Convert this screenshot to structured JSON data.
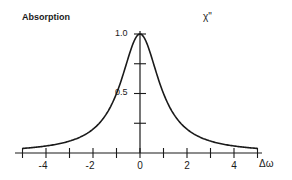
{
  "chart_data": {
    "type": "line",
    "title": "Absorption",
    "series_label": "χ\"",
    "xlabel": "Δω",
    "ylabel": "",
    "xlim": [
      -5,
      5
    ],
    "ylim": [
      0,
      1.0
    ],
    "x_ticks": [
      -5,
      -4,
      -3,
      -2,
      -1,
      0,
      1,
      2,
      3,
      4,
      5
    ],
    "x_tick_labels": [
      "-4",
      "-2",
      "0",
      "2",
      "4"
    ],
    "x_tick_label_values": [
      -4,
      -2,
      0,
      2,
      4
    ],
    "y_ticks": [
      0.25,
      0.5,
      0.75,
      1.0
    ],
    "y_tick_labels": [
      "0.5",
      "1.0"
    ],
    "y_tick_label_values": [
      0.5,
      1.0
    ],
    "grid": false,
    "legend": null,
    "series": [
      {
        "name": "χ\"",
        "function": "1/(1+Δω²)",
        "x": [
          -5,
          -4,
          -3,
          -2,
          -1.5,
          -1,
          -0.5,
          0,
          0.5,
          1,
          1.5,
          2,
          3,
          4,
          5
        ],
        "y": [
          0.038,
          0.059,
          0.1,
          0.2,
          0.308,
          0.5,
          0.8,
          1.0,
          0.8,
          0.5,
          0.308,
          0.2,
          0.1,
          0.059,
          0.038
        ]
      }
    ]
  },
  "labels": {
    "title": "Absorption",
    "series": "χ\"",
    "xaxis": "Δω",
    "ytick_top": "1.0",
    "ytick_mid": "0.5"
  },
  "colors": {
    "ink": "#1a1a1a",
    "background": "#ffffff"
  }
}
